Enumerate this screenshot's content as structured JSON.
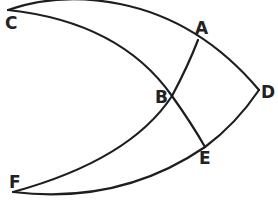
{
  "diagram": {
    "type": "geometry-arcs",
    "points": [
      {
        "id": "A",
        "label": "A",
        "x": 198,
        "y": 40,
        "label_x": 195,
        "label_y": 34
      },
      {
        "id": "B",
        "label": "B",
        "x": 172,
        "y": 96,
        "label_x": 155,
        "label_y": 103
      },
      {
        "id": "C",
        "label": "C",
        "x": 8,
        "y": 10,
        "label_x": 5,
        "label_y": 29
      },
      {
        "id": "D",
        "label": "D",
        "x": 259,
        "y": 90,
        "label_x": 261,
        "label_y": 98
      },
      {
        "id": "E",
        "label": "E",
        "x": 205,
        "y": 147,
        "label_x": 202,
        "label_y": 164
      },
      {
        "id": "F",
        "label": "F",
        "x": 13,
        "y": 192,
        "label_x": 9,
        "label_y": 188
      }
    ],
    "arcs": [
      {
        "name": "arc-C-A-D",
        "through": [
          "C",
          "A",
          "D"
        ]
      },
      {
        "name": "arc-C-B-E",
        "through": [
          "C",
          "B",
          "E"
        ]
      },
      {
        "name": "arc-F-B-A",
        "through": [
          "F",
          "B",
          "A"
        ]
      },
      {
        "name": "arc-F-E-D",
        "through": [
          "F",
          "E",
          "D"
        ]
      }
    ],
    "colors": {
      "stroke": "#1e1e1e",
      "label": "#222222",
      "background": "#ffffff"
    }
  }
}
